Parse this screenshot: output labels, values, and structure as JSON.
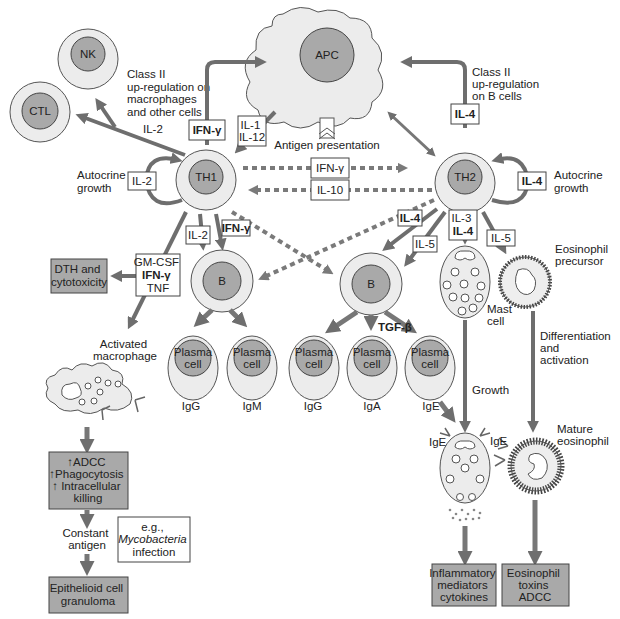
{
  "diagram": {
    "colors": {
      "cell_outer": "#ececec",
      "cell_nucleus": "#a9a9a9",
      "arrow": "#6e6e6e",
      "outcome_box": "#a9a9a9"
    },
    "cells": {
      "apc": "APC",
      "nk": "NK",
      "ctl": "CTL",
      "th1": "TH1",
      "th2": "TH2",
      "b_left": "B",
      "b_right": "B",
      "plasma_line1": "Plasma",
      "plasma_line2": "cell",
      "mast_cell": [
        "Mast",
        "cell"
      ],
      "eosinophil_precursor": [
        "Eosinophil",
        "precursor"
      ],
      "mature_eosinophil": [
        "Mature",
        "eosinophil"
      ],
      "activated_macrophage": [
        "Activated",
        "macrophage"
      ]
    },
    "plasma_outputs": [
      "IgG",
      "IgM",
      "IgG",
      "IgA",
      "IgE"
    ],
    "cytokine_boxes": {
      "th1_ifng_up": "IFN-γ",
      "il1_il12": [
        "IL-1",
        "IL-12"
      ],
      "th1_autocrine": "IL-2",
      "th2_il4_up": "IL-4",
      "th2_autocrine": "IL-4",
      "center_ifng": "IFN-γ",
      "center_il10": "IL-10",
      "th1_il2_down": "IL-2",
      "th1_ifng_down": "IFN-γ",
      "gmcsf_box": [
        "GM-CSF",
        "IFN-γ",
        "TNF"
      ],
      "th2_il4_diag": "IL-4",
      "th2_il5_b": "IL-5",
      "th2_il3_il4": [
        "IL-3",
        "IL-4"
      ],
      "th2_il5_eos": "IL-5"
    },
    "labels": {
      "il2_ctl": "IL-2",
      "class2_macrophages": [
        "Class II",
        "up-regulation on",
        "macrophages",
        "and other cells"
      ],
      "class2_bcells": [
        "Class II",
        "up-regulation",
        "on B cells"
      ],
      "antigen_presentation": "Antigen presentation",
      "autocrine_left": [
        "Autocrine",
        "growth"
      ],
      "autocrine_right": [
        "Autocrine",
        "growth"
      ],
      "tgf_beta": "TGF-β",
      "growth": "Growth",
      "differentiation": [
        "Differentiation",
        "and",
        "activation"
      ],
      "ige_mast": "IgE",
      "ige_eos": "IgE",
      "constant_antigen": [
        "Constant",
        "antigen"
      ]
    },
    "outcome_boxes": {
      "dth": [
        "DTH and",
        "cytotoxicity"
      ],
      "macrophage_effects": [
        "↑ADCC",
        "↑Phagocytosis",
        "↑ Intracellular",
        "killing"
      ],
      "granuloma": [
        "Epithelioid cell",
        "granuloma"
      ],
      "mycobacteria": [
        "e.g.,",
        "Mycobacteria",
        "infection"
      ],
      "inflammatory": [
        "Inflammatory",
        "mediators",
        "cytokines"
      ],
      "eosinophil_effects": [
        "Eosinophil",
        "toxins",
        "ADCC"
      ]
    }
  }
}
